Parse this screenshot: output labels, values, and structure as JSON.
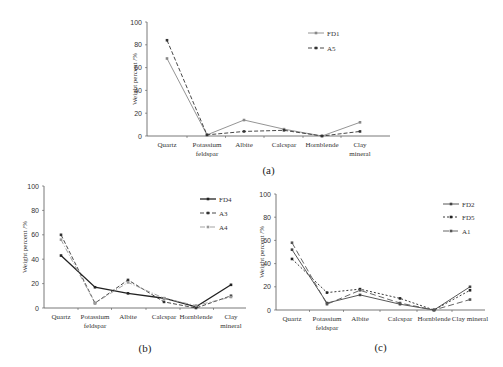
{
  "chart_data": [
    {
      "id": "a",
      "type": "line",
      "caption": "(a)",
      "ylabel": "Weight percent /%",
      "xlabel": "",
      "ylim": [
        0,
        100
      ],
      "yticks": [
        0,
        20,
        40,
        60,
        80,
        100
      ],
      "categories": [
        "Quartz",
        "Potassium feldspar",
        "Albite",
        "Calcspar",
        "Hornblende",
        "Clay mineral"
      ],
      "category_lines": [
        [
          "Quartz"
        ],
        [
          "Potassium",
          "feldspar"
        ],
        [
          "Albite"
        ],
        [
          "Calcspar"
        ],
        [
          "Hornblende"
        ],
        [
          "Clay",
          "mineral"
        ]
      ],
      "grid": false,
      "legend_position": "upper right",
      "series": [
        {
          "name": "FD1",
          "style": "solid",
          "color": "#888888",
          "values": [
            68,
            1,
            14,
            6,
            0,
            12
          ]
        },
        {
          "name": "A5",
          "style": "dashed",
          "color": "#333333",
          "values": [
            84,
            1,
            4,
            5,
            0,
            4
          ]
        }
      ]
    },
    {
      "id": "b",
      "type": "line",
      "caption": "(b)",
      "ylabel": "Weight percent /%",
      "xlabel": "",
      "ylim": [
        0,
        100
      ],
      "yticks": [
        0,
        20,
        40,
        60,
        80,
        100
      ],
      "categories": [
        "Quartz",
        "Potassium feldspar",
        "Albite",
        "Calcspar",
        "Hornblende",
        "Clay mineral"
      ],
      "category_lines": [
        [
          "Quartz"
        ],
        [
          "Potassium",
          "feldspar"
        ],
        [
          "Albite"
        ],
        [
          "Calcspar"
        ],
        [
          "Hornblende"
        ],
        [
          "Clay",
          "mineral"
        ]
      ],
      "grid": false,
      "legend_position": "upper right",
      "series": [
        {
          "name": "FD4",
          "style": "solid-bold",
          "color": "#222222",
          "values": [
            43,
            17,
            12,
            8,
            1,
            19
          ]
        },
        {
          "name": "A3",
          "style": "dashed",
          "color": "#333333",
          "values": [
            60,
            4,
            23,
            5,
            0,
            10
          ]
        },
        {
          "name": "A4",
          "style": "dashdot",
          "color": "#999999",
          "values": [
            56,
            4,
            21,
            8,
            2,
            9
          ]
        }
      ]
    },
    {
      "id": "c",
      "type": "line",
      "caption": "(c)",
      "ylabel": "Weight percent /%",
      "xlabel": "",
      "ylim": [
        0,
        100
      ],
      "yticks": [
        0,
        20,
        40,
        60,
        80,
        100
      ],
      "categories": [
        "Quartz",
        "Potassium feldspar",
        "Albite",
        "Calcspar",
        "Hornblende",
        "Clay mineral"
      ],
      "category_lines": [
        [
          "Quartz"
        ],
        [
          "Potassium",
          "feldspar"
        ],
        [
          "Albite"
        ],
        [
          "Calcspar"
        ],
        [
          "Hornblende"
        ],
        [
          "Clay mineral"
        ]
      ],
      "grid": false,
      "legend_position": "upper right",
      "series": [
        {
          "name": "FD2",
          "style": "solid",
          "color": "#444444",
          "values": [
            52,
            6,
            13,
            5,
            0,
            20
          ]
        },
        {
          "name": "FD5",
          "style": "dotted-dash",
          "color": "#222222",
          "values": [
            44,
            15,
            18,
            10,
            0,
            17
          ]
        },
        {
          "name": "A1",
          "style": "longdash",
          "color": "#555555",
          "values": [
            58,
            5,
            17,
            6,
            0,
            9
          ]
        }
      ]
    }
  ]
}
